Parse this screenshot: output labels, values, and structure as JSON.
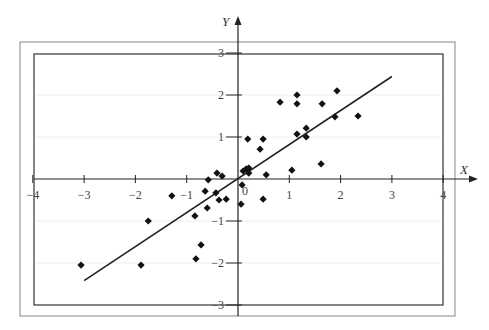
{
  "chart_data": {
    "type": "scatter",
    "title": "",
    "xlabel": "X",
    "ylabel": "Y",
    "xlim": [
      -4,
      4
    ],
    "ylim": [
      -3,
      3
    ],
    "x_ticks": [
      -4,
      -3,
      -2,
      -1,
      0,
      1,
      2,
      3,
      4
    ],
    "y_ticks": [
      -3,
      -2,
      -1,
      1,
      2,
      3
    ],
    "origin_label": "0",
    "grid": "horizontal faint lines at y = -2, -1, 1, 2",
    "marker": "diamond",
    "points": [
      {
        "x": -3.06,
        "y": -2.05
      },
      {
        "x": -1.89,
        "y": -2.05
      },
      {
        "x": -1.75,
        "y": -1.0
      },
      {
        "x": -1.29,
        "y": -0.4
      },
      {
        "x": -0.82,
        "y": -1.9
      },
      {
        "x": -0.72,
        "y": -1.57
      },
      {
        "x": -0.84,
        "y": -0.88
      },
      {
        "x": -0.64,
        "y": -0.29
      },
      {
        "x": -0.6,
        "y": -0.69
      },
      {
        "x": -0.58,
        "y": -0.02
      },
      {
        "x": -0.43,
        "y": -0.33
      },
      {
        "x": -0.41,
        "y": 0.14
      },
      {
        "x": -0.31,
        "y": 0.07
      },
      {
        "x": -0.37,
        "y": -0.5
      },
      {
        "x": -0.23,
        "y": -0.48
      },
      {
        "x": 0.08,
        "y": -0.14
      },
      {
        "x": 0.06,
        "y": -0.6
      },
      {
        "x": 0.1,
        "y": 0.19
      },
      {
        "x": 0.16,
        "y": 0.24
      },
      {
        "x": 0.21,
        "y": 0.26
      },
      {
        "x": 0.21,
        "y": 0.14
      },
      {
        "x": 0.55,
        "y": 0.1
      },
      {
        "x": 0.49,
        "y": -0.48
      },
      {
        "x": 0.19,
        "y": 0.95
      },
      {
        "x": 0.49,
        "y": 0.95
      },
      {
        "x": 0.43,
        "y": 0.71
      },
      {
        "x": 0.82,
        "y": 1.83
      },
      {
        "x": 1.15,
        "y": 2.0
      },
      {
        "x": 1.15,
        "y": 1.79
      },
      {
        "x": 1.64,
        "y": 1.79
      },
      {
        "x": 1.93,
        "y": 2.1
      },
      {
        "x": 1.89,
        "y": 1.48
      },
      {
        "x": 2.34,
        "y": 1.5
      },
      {
        "x": 1.15,
        "y": 1.07
      },
      {
        "x": 1.33,
        "y": 1.21
      },
      {
        "x": 1.33,
        "y": 1.0
      },
      {
        "x": 1.05,
        "y": 0.21
      },
      {
        "x": 1.62,
        "y": 0.36
      }
    ],
    "regression_line": {
      "x1": -3.0,
      "y1": -2.42,
      "x2": 3.0,
      "y2": 2.44,
      "slope_approx": 0.81
    },
    "legend": null
  },
  "colors": {
    "points": "#111111",
    "line": "#222222",
    "axes": "#222222",
    "frame_outer": "#888888",
    "frame_inner": "#333333",
    "grid": "#eeeeee"
  }
}
